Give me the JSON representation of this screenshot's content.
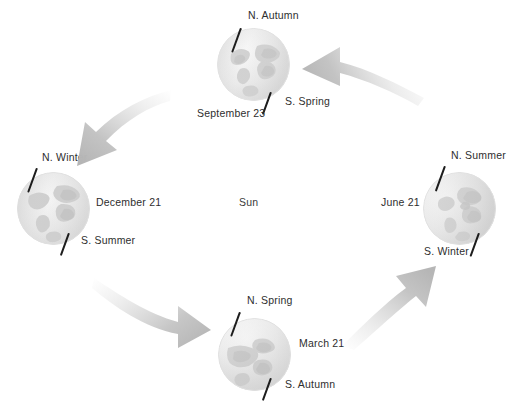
{
  "diagram": {
    "center_label": "Sun",
    "globe_colors": {
      "ocean_light": "#f2f2f2",
      "ocean_mid": "#e4e4e4",
      "land": "#d2d2d2",
      "land_dark": "#c2c2c2",
      "shadow": "#cfcfcf",
      "highlight": "#fafafa"
    },
    "arrow_color": "#c9c9c9",
    "axis_color": "#1d1d1d",
    "text_color": "#2e2e2e",
    "positions": [
      {
        "id": "september",
        "date_label": "September 23",
        "north_label": "N. Autumn",
        "south_label": "S. Spring"
      },
      {
        "id": "december",
        "date_label": "December 21",
        "north_label": "N. Winter",
        "south_label": "S. Summer"
      },
      {
        "id": "march",
        "date_label": "March 21",
        "north_label": "N. Spring",
        "south_label": "S. Autumn"
      },
      {
        "id": "june",
        "date_label": "June 21",
        "north_label": "N. Summer",
        "south_label": "S. Winter"
      }
    ],
    "arrows": [
      {
        "id": "arrow-top-right",
        "direction": "left",
        "from": "june",
        "to": "september"
      },
      {
        "id": "arrow-top-left",
        "direction": "down-left",
        "from": "september",
        "to": "december"
      },
      {
        "id": "arrow-bottom-left",
        "direction": "right",
        "from": "december",
        "to": "march"
      },
      {
        "id": "arrow-bottom-right",
        "direction": "up-right",
        "from": "march",
        "to": "june"
      }
    ]
  }
}
